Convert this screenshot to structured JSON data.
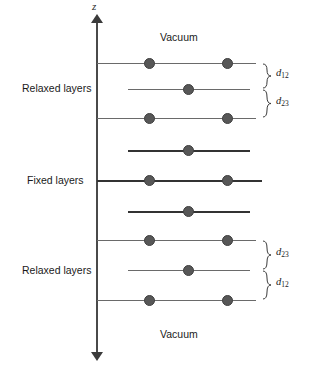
{
  "figure": {
    "width": 331,
    "height": 367,
    "background": "#ffffff",
    "type": "slab-geometry-schematic"
  },
  "axis": {
    "label": "z",
    "direction": "vertical",
    "arrow_top": true,
    "arrow_bottom": true,
    "color": "#4a4a4a"
  },
  "region_labels": {
    "vacuum_top": "Vacuum",
    "vacuum_bottom": "Vacuum",
    "relaxed_top": "Relaxed layers",
    "fixed_middle": "Fixed layers",
    "relaxed_bottom": "Relaxed layers"
  },
  "spacing_labels": {
    "top_upper": "d",
    "top_upper_sub": "12",
    "top_lower": "d",
    "top_lower_sub": "23",
    "bottom_upper": "d",
    "bottom_upper_sub": "23",
    "bottom_lower": "d",
    "bottom_lower_sub": "12"
  },
  "colors": {
    "atom": "#575757",
    "atom_border": "#3f3f3f",
    "line_thin": "#6a6a6a",
    "line_thick": "#333333",
    "axis": "#4a4a4a",
    "text": "#1a1a1a"
  },
  "layers": [
    {
      "id": "L1",
      "y": 63,
      "x_start": 97,
      "x_end": 256,
      "weight": "thin",
      "atoms": [
        150,
        228
      ],
      "region": "relaxed-top"
    },
    {
      "id": "L2",
      "y": 89,
      "x_start": 128,
      "x_end": 250,
      "weight": "thin",
      "atoms": [
        189
      ],
      "region": "relaxed-top"
    },
    {
      "id": "L3",
      "y": 118,
      "x_start": 97,
      "x_end": 256,
      "weight": "thin",
      "atoms": [
        150,
        228
      ],
      "region": "relaxed-top"
    },
    {
      "id": "L4",
      "y": 150,
      "x_start": 128,
      "x_end": 250,
      "weight": "thick",
      "atoms": [
        189
      ],
      "region": "fixed"
    },
    {
      "id": "L5",
      "y": 180,
      "x_start": 97,
      "x_end": 262,
      "weight": "thick",
      "atoms": [
        150,
        228
      ],
      "region": "fixed"
    },
    {
      "id": "L6",
      "y": 211,
      "x_start": 128,
      "x_end": 250,
      "weight": "thick",
      "atoms": [
        189
      ],
      "region": "fixed"
    },
    {
      "id": "L7",
      "y": 240,
      "x_start": 97,
      "x_end": 256,
      "weight": "thin",
      "atoms": [
        150,
        228
      ],
      "region": "relaxed-bottom"
    },
    {
      "id": "L8",
      "y": 270,
      "x_start": 128,
      "x_end": 250,
      "weight": "thin",
      "atoms": [
        189
      ],
      "region": "relaxed-bottom"
    },
    {
      "id": "L9",
      "y": 300,
      "x_start": 97,
      "x_end": 256,
      "weight": "thin",
      "atoms": [
        150,
        228
      ],
      "region": "relaxed-bottom"
    }
  ],
  "braces": [
    {
      "id": "B1",
      "y_top": 63,
      "y_bottom": 89,
      "label": "d",
      "sub": "12"
    },
    {
      "id": "B2",
      "y_top": 89,
      "y_bottom": 118,
      "label": "d",
      "sub": "23"
    },
    {
      "id": "B3",
      "y_top": 240,
      "y_bottom": 270,
      "label": "d",
      "sub": "23"
    },
    {
      "id": "B4",
      "y_top": 270,
      "y_bottom": 300,
      "label": "d",
      "sub": "12"
    }
  ]
}
